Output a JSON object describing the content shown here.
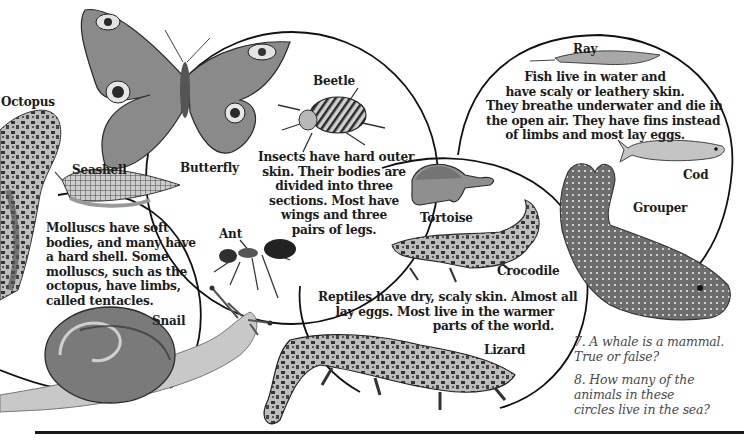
{
  "page": {
    "style": "grayscale textbook illustration",
    "colors": {
      "ink": "#1c1c1c",
      "question_text": "#4a4a4a",
      "circle_stroke": "#111111",
      "background": "#ffffff"
    }
  },
  "groups": {
    "molluscs": {
      "description_lines": [
        "Molluscs have soft",
        "bodies, and many have",
        "a hard shell. Some",
        "molluscs, such as the",
        "octopus, have limbs,",
        "called tentacles."
      ],
      "animals": {
        "octopus": "Octopus",
        "seashell": "Seashell",
        "snail": "Snail"
      }
    },
    "insects": {
      "description_lines": [
        "Insects have hard outer",
        "skin. Their bodies are",
        "divided into three",
        "sections. Most have",
        "wings and three",
        "pairs of legs."
      ],
      "animals": {
        "butterfly": "Butterfly",
        "beetle": "Beetle",
        "ant": "Ant"
      }
    },
    "reptiles": {
      "description_lines": [
        "Reptiles have dry, scaly skin. Almost all",
        "lay eggs. Most live in the warmer",
        "parts of the world."
      ],
      "animals": {
        "tortoise": "Tortoise",
        "crocodile": "Crocodile",
        "lizard": "Lizard"
      }
    },
    "fish": {
      "description_lines": [
        "Fish live in water and",
        "have scaly or leathery skin.",
        "They breathe underwater and die in",
        "the open air. They have fins instead",
        "of limbs and most lay eggs."
      ],
      "animals": {
        "ray": "Ray",
        "cod": "Cod",
        "grouper": "Grouper"
      }
    }
  },
  "questions": [
    {
      "lines": [
        "7. A whale is a mammal.",
        "True or false?"
      ]
    },
    {
      "lines": [
        "8. How many of the",
        "animals in these",
        "circles live in the sea?"
      ]
    }
  ]
}
